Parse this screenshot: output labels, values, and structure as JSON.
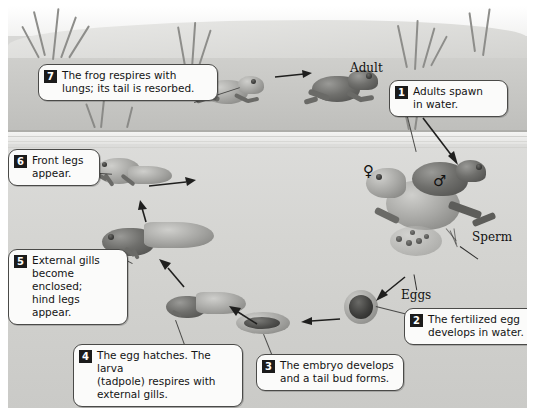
{
  "diagram": {
    "background_color": "#d8d8d6",
    "waterline_label": "water surface"
  },
  "labels": {
    "adult": "Adult",
    "sperm": "Sperm",
    "eggs": "Eggs",
    "female_symbol": "♀",
    "male_symbol": "♂"
  },
  "steps": [
    {
      "number": "1",
      "text": "Adults spawn in water.",
      "lines": [
        "Adults spawn",
        "in water."
      ]
    },
    {
      "number": "2",
      "text": "The fertilized egg develops in water.",
      "lines": [
        "The fertilized egg",
        "develops in water."
      ]
    },
    {
      "number": "3",
      "text": "The embryo develops and a tail bud forms.",
      "lines": [
        "The embryo develops",
        "and a tail bud forms."
      ]
    },
    {
      "number": "4",
      "text": "The egg hatches. The larva (tadpole) respires with external gills.",
      "lines": [
        "The egg hatches. The larva",
        "(tadpole) respires with",
        "external gills."
      ]
    },
    {
      "number": "5",
      "text": "External gills become enclosed; hind legs appear.",
      "lines": [
        "External gills",
        "become enclosed;",
        "hind legs appear."
      ]
    },
    {
      "number": "6",
      "text": "Front legs appear.",
      "lines": [
        "Front legs",
        "appear."
      ]
    },
    {
      "number": "7",
      "text": "The frog respires with lungs; its tail is resorbed.",
      "lines": [
        "The frog respires with",
        "lungs; its tail is resorbed."
      ]
    }
  ]
}
